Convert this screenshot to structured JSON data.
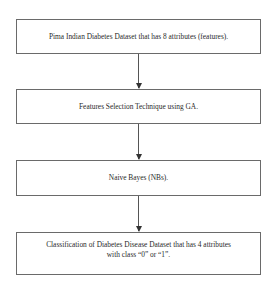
{
  "diagram": {
    "type": "flowchart",
    "direction": "top-to-bottom",
    "nodes": [
      {
        "id": "step1",
        "label": "Pima Indian Diabetes Dataset that has 8 attributes (features)."
      },
      {
        "id": "step2",
        "label": "Features Selection Technique using GA."
      },
      {
        "id": "step3",
        "label": "Naive Bayes (NBs)."
      },
      {
        "id": "step4",
        "label_line1": "Classification of Diabetes Disease Dataset that has 4 attributes",
        "label_line2": "with class “0” or “1”."
      }
    ],
    "edges": [
      {
        "from": "step1",
        "to": "step2"
      },
      {
        "from": "step2",
        "to": "step3"
      },
      {
        "from": "step3",
        "to": "step4"
      }
    ],
    "colors": {
      "border": "#6a6a6a",
      "arrow": "#555555",
      "text": "#2a2a2a",
      "background": "#ffffff"
    }
  }
}
